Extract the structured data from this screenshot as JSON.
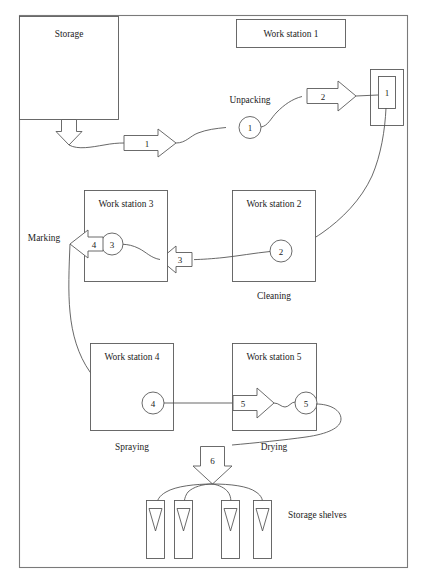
{
  "diagram": {
    "frame": {
      "name": "outer-frame"
    },
    "colors": {
      "stroke": "#5a5a5a",
      "frame": "#7a7a7a",
      "text": "#1c1c1c",
      "background": "#ffffff"
    },
    "boxes": [
      {
        "id": "storage",
        "label": "Storage"
      },
      {
        "id": "work-station-1",
        "label": "Work station 1"
      },
      {
        "id": "work-station-2",
        "label": "Work station 2"
      },
      {
        "id": "work-station-3",
        "label": "Work station 3"
      },
      {
        "id": "work-station-4",
        "label": "Work station 4"
      },
      {
        "id": "work-station-5",
        "label": "Work station 5"
      },
      {
        "id": "machine-1",
        "label": "1"
      }
    ],
    "process_labels": [
      {
        "id": "unpacking",
        "label": "Unpacking"
      },
      {
        "id": "cleaning",
        "label": "Cleaning"
      },
      {
        "id": "marking",
        "label": "Marking"
      },
      {
        "id": "spraying",
        "label": "Spraying"
      },
      {
        "id": "drying",
        "label": "Drying"
      },
      {
        "id": "storage-shelves",
        "label": "Storage shelves"
      }
    ],
    "operation_nodes": [
      {
        "id": "op-1",
        "label": "1",
        "station": "Unpacking"
      },
      {
        "id": "op-2",
        "label": "2",
        "station": "Work station 2"
      },
      {
        "id": "op-3",
        "label": "3",
        "station": "Work station 3"
      },
      {
        "id": "op-4",
        "label": "4",
        "station": "Work station 4"
      },
      {
        "id": "op-5",
        "label": "5",
        "station": "Work station 5"
      }
    ],
    "transport_arrows": [
      {
        "id": "arrow-1",
        "label": "1",
        "direction": "right"
      },
      {
        "id": "arrow-2",
        "label": "2",
        "direction": "right"
      },
      {
        "id": "arrow-3",
        "label": "3",
        "direction": "left"
      },
      {
        "id": "arrow-4",
        "label": "4",
        "direction": "left"
      },
      {
        "id": "arrow-5",
        "label": "5",
        "direction": "right"
      },
      {
        "id": "arrow-6",
        "label": "6",
        "direction": "down"
      },
      {
        "id": "arrow-storage-out",
        "label": "",
        "direction": "down"
      }
    ],
    "shelves": [
      {
        "id": "shelf-1"
      },
      {
        "id": "shelf-2"
      },
      {
        "id": "shelf-3"
      },
      {
        "id": "shelf-4"
      }
    ]
  }
}
